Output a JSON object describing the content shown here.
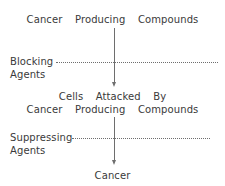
{
  "diagram": {
    "title_flow": "cancer-pathway-flowchart",
    "background_color": "#ffffff",
    "text_color": "#3a3a3a",
    "line_color": "#6e6e6e",
    "nodes": {
      "top": "Cancer  Producing  Compounds",
      "middle_line1": "Cells  Attacked  By",
      "middle_line2": "Cancer  Producing  Compounds",
      "bottom": "Cancer"
    },
    "modifiers": {
      "blocking_label": "Blocking",
      "blocking_sub": "Agents",
      "suppressing_label": "Suppressing",
      "suppressing_sub": "Agents"
    }
  }
}
